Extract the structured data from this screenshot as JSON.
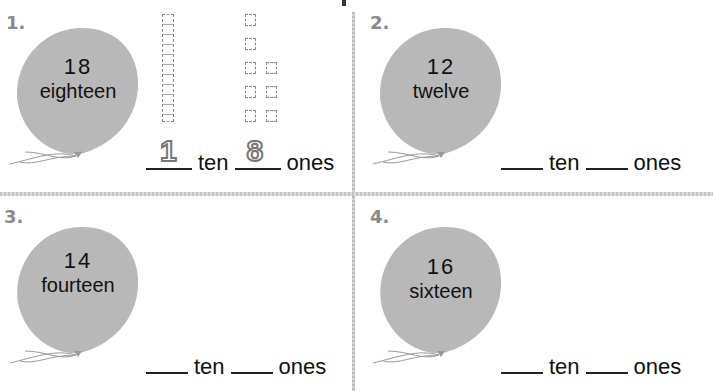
{
  "worksheet": {
    "problems": [
      {
        "number": "1.",
        "numeral": "18",
        "word": "eighteen",
        "tens_answer": "1",
        "ones_answer": "8",
        "tens_label": "ten",
        "ones_label": "ones",
        "model": {
          "tens_rods": 1,
          "ones_cubes": 8
        }
      },
      {
        "number": "2.",
        "numeral": "12",
        "word": "twelve",
        "tens_answer": "",
        "ones_answer": "",
        "tens_label": "ten",
        "ones_label": "ones"
      },
      {
        "number": "3.",
        "numeral": "14",
        "word": "fourteen",
        "tens_answer": "",
        "ones_answer": "",
        "tens_label": "ten",
        "ones_label": "ones"
      },
      {
        "number": "4.",
        "numeral": "16",
        "word": "sixteen",
        "tens_answer": "",
        "ones_answer": "",
        "tens_label": "ten",
        "ones_label": "ones"
      }
    ],
    "colors": {
      "balloon": "#b8b8b8",
      "number_label": "#8a8a8a",
      "divider": "#c4c4c4"
    }
  }
}
